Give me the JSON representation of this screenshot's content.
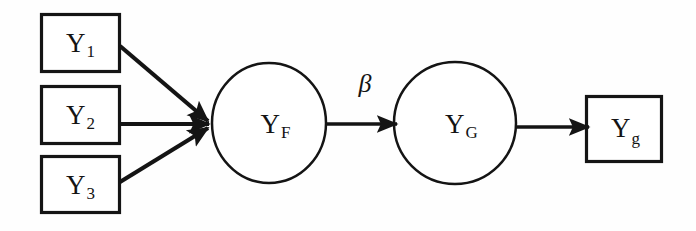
{
  "diagram": {
    "background_color": "#fefefe",
    "stroke_color": "#141414",
    "observed_indicators": [
      {
        "id": "y1",
        "label": "Y",
        "subscript": "1",
        "shape": "rectangle",
        "x": 41,
        "y": 14,
        "w": 79,
        "h": 58
      },
      {
        "id": "y2",
        "label": "Y",
        "subscript": "2",
        "shape": "rectangle",
        "x": 41,
        "y": 86,
        "w": 79,
        "h": 58
      },
      {
        "id": "y3",
        "label": "Y",
        "subscript": "3",
        "shape": "rectangle",
        "x": 41,
        "y": 156,
        "w": 79,
        "h": 57
      }
    ],
    "latent_factors": [
      {
        "id": "yf",
        "label": "Y",
        "subscript": "F",
        "shape": "circle",
        "cx": 269,
        "cy": 123,
        "rx": 58,
        "ry": 60
      },
      {
        "id": "yg",
        "label": "Y",
        "subscript": "G",
        "shape": "circle",
        "cx": 455,
        "cy": 123,
        "rx": 61,
        "ry": 61
      }
    ],
    "outcome_indicators": [
      {
        "id": "yg_obs",
        "label": "Y",
        "subscript": "g",
        "shape": "rectangle",
        "x": 586,
        "y": 96,
        "w": 76,
        "h": 66
      }
    ],
    "paths": [
      {
        "id": "y1-to-yf",
        "from": "y1",
        "to": "yf",
        "label": ""
      },
      {
        "id": "y2-to-yf",
        "from": "y2",
        "to": "yf",
        "label": ""
      },
      {
        "id": "y3-to-yf",
        "from": "y3",
        "to": "yf",
        "label": ""
      },
      {
        "id": "yf-to-yg",
        "from": "yf",
        "to": "yg",
        "label": "β"
      },
      {
        "id": "yg-to-yg_obs",
        "from": "yg",
        "to": "yg_obs",
        "label": ""
      }
    ],
    "coefficient_label": "β"
  }
}
